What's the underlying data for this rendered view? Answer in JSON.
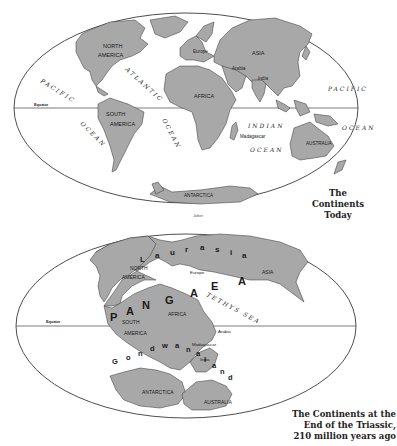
{
  "colors": {
    "land": "#a8a8a8",
    "outline": "#3a3a3a",
    "ocean": "#ffffff",
    "text": "#1a1a1a"
  },
  "map_today": {
    "caption_line1": "The Continents",
    "caption_line2": "Today",
    "equator_label": "Equator",
    "continent_labels": {
      "north_america_1": "NORTH",
      "north_america_2": "AMERICA",
      "south_america_1": "SOUTH",
      "south_america_2": "AMERICA",
      "europe": "Europe",
      "asia": "ASIA",
      "arabia": "Arabia",
      "india": "India",
      "africa": "AFRICA",
      "madagascar": "Madagascar",
      "australia": "AUSTRALIA",
      "antarctica": "ANTARCTICA"
    },
    "ocean_labels": {
      "pacific_west_1": "PACIFIC",
      "pacific_west_2": "OCEAN",
      "atlantic_1": "ATLANTIC",
      "atlantic_2": "OCEAN",
      "indian_1": "INDIAN",
      "indian_2": "OCEAN",
      "pacific_east_1": "PACIFIC",
      "pacific_east_2": "OCEAN"
    }
  },
  "credit": "Jober",
  "map_triassic": {
    "caption_line1": "The Continents at the",
    "caption_line2": "End of the Triassic,",
    "caption_line3": "210 million years ago",
    "equator_label": "Equator",
    "supercontinent_letters": [
      "P",
      "A",
      "N",
      "G",
      "A",
      "E",
      "A"
    ],
    "laurasia_letters": [
      "L",
      "a",
      "u",
      "r",
      "a",
      "s",
      "i",
      "a"
    ],
    "gondwanaland_letters": [
      "G",
      "o",
      "n",
      "d",
      "w",
      "a",
      "n",
      "a",
      "l",
      "a",
      "n",
      "d"
    ],
    "tethys_sea": "TETHYS SEA",
    "continent_labels": {
      "north_america_1": "NORTH",
      "north_america_2": "AMERICA",
      "south_america_1": "SOUTH",
      "south_america_2": "AMERICA",
      "europe": "Europe",
      "asia": "ASIA",
      "africa": "AFRICA",
      "arabia": "Arabia",
      "madagascar": "Madagascar",
      "india": "India",
      "antarctica": "ANTARCTICA",
      "australia": "AUSTRALIA"
    }
  }
}
